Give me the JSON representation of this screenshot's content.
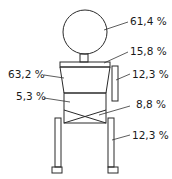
{
  "diagram": {
    "type": "body-segment mass distribution figure",
    "labels": {
      "head": "61,4 %",
      "shoulder_plate": "15,8 %",
      "arm": "12,3 %",
      "torso_upper": "63,2 %",
      "torso_lower": "5,3 %",
      "pelvis": "8,8 %",
      "leg": "12,3 %"
    },
    "stroke_color": "#2a2a2a",
    "background": "#ffffff"
  }
}
